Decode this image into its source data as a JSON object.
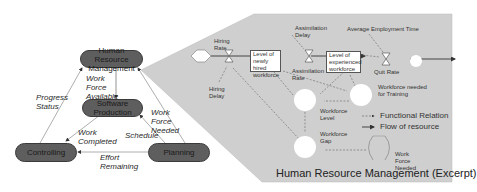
{
  "overview": {
    "nodes": {
      "hrm": "Human Resource Management",
      "software": "Software Production",
      "controlling": "Controlling",
      "planning": "Planning"
    },
    "edges": {
      "work_force_available": "Work Force Available",
      "progress_status": "Progress Status",
      "work_force_needed": "Work Force Needed",
      "schedule": "Schedule",
      "work_completed": "Work Completed",
      "effort_remaining": "Effort Remaining"
    }
  },
  "excerpt": {
    "title": "Human Resource Management (Excerpt)",
    "hiring_rate": "Hiring Rate",
    "hiring_delay": "Hiring Delay",
    "level_newly_hired": "Level of newly hired workforce",
    "assimilation_delay": "Assimilation Delay",
    "assimilation_rate": "Assimilation Rate",
    "level_experienced": "Level of experienced workforce",
    "average_employment_time": "Average Employment Time",
    "quit_rate": "Quit Rate",
    "workforce_needed_training": "Workforce needed for Training",
    "workforce_level": "Workforce Level",
    "workforce_gap": "Workforce Gap",
    "work_force_needed": "Work Force Needed"
  },
  "legend": {
    "functional_relation": "Functional Relation",
    "flow_of_resource": "Flow of resource"
  },
  "colors": {
    "node_fill": "#5e5e5e",
    "panel_fill": "#cfcfcf",
    "line": "#555555"
  }
}
